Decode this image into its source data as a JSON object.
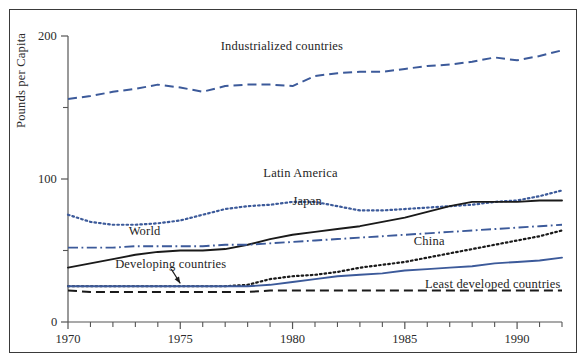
{
  "figure": {
    "background_color": "#ffffff",
    "frame_color": "#3a3a3a",
    "axis_color": "#555555",
    "blue": "#3c5a9a",
    "black": "#1a1a1a"
  },
  "chart_data": {
    "type": "line",
    "title": "",
    "subtitle": "",
    "xlabel": "",
    "ylabel": "Pounds per Capita",
    "xlim": [
      1970,
      1992
    ],
    "ylim": [
      0,
      200
    ],
    "grid": false,
    "legend_position": "inline-annotations",
    "x_major_ticks": [
      1970,
      1975,
      1980,
      1985,
      1990
    ],
    "x_major_tick_labels": [
      "1970",
      "1975",
      "1980",
      "1985",
      "1990"
    ],
    "x_minor_ticks": [
      1971,
      1972,
      1973,
      1974,
      1976,
      1977,
      1978,
      1979,
      1981,
      1982,
      1983,
      1984,
      1986,
      1987,
      1988,
      1989,
      1991,
      1992
    ],
    "y_major_ticks": [
      0,
      100,
      200
    ],
    "y_major_tick_labels": [
      "0",
      "100",
      "200"
    ],
    "y_minor_ticks": [
      50,
      150
    ],
    "x": [
      1970,
      1971,
      1972,
      1973,
      1974,
      1975,
      1976,
      1977,
      1978,
      1979,
      1980,
      1981,
      1982,
      1983,
      1984,
      1985,
      1986,
      1987,
      1988,
      1989,
      1990,
      1991,
      1992
    ],
    "series": [
      {
        "name": "Industrialized countries",
        "color": "#3c5a9a",
        "style": "dashed",
        "label_x": 1976.8,
        "label_y": 193,
        "values": [
          156,
          158,
          161,
          163,
          166,
          164,
          161,
          165,
          166,
          166,
          165,
          172,
          174,
          175,
          175,
          177,
          179,
          180,
          182,
          185,
          183,
          186,
          190
        ]
      },
      {
        "name": "Latin America",
        "color": "#3c5a9a",
        "style": "dotted",
        "label_x": 1978.7,
        "label_y": 104,
        "values": [
          75,
          70,
          68,
          68,
          69,
          71,
          75,
          79,
          81,
          82,
          84,
          84,
          81,
          78,
          78,
          79,
          80,
          81,
          82,
          84,
          85,
          88,
          92
        ]
      },
      {
        "name": "Japan",
        "color": "#1a1a1a",
        "style": "solid",
        "label_x": 1980.0,
        "label_y": 84,
        "values": [
          38,
          41,
          44,
          47,
          49,
          50,
          50,
          51,
          54,
          58,
          61,
          63,
          65,
          67,
          70,
          73,
          77,
          81,
          84,
          84,
          84,
          85,
          85
        ]
      },
      {
        "name": "World",
        "color": "#3c5a9a",
        "style": "dashdot",
        "label_x": 1972.7,
        "label_y": 63,
        "values": [
          52,
          52,
          52,
          53,
          53,
          53,
          53,
          54,
          54,
          55,
          56,
          57,
          58,
          59,
          60,
          61,
          62,
          63,
          64,
          65,
          66,
          67,
          68
        ]
      },
      {
        "name": "China",
        "color": "#1a1a1a",
        "style": "dotted",
        "label_x": 1985.4,
        "label_y": 56,
        "values": [
          25,
          25,
          25,
          25,
          25,
          25,
          25,
          25,
          26,
          30,
          32,
          33,
          35,
          38,
          40,
          42,
          45,
          48,
          51,
          54,
          57,
          60,
          64
        ]
      },
      {
        "name": "Developing countries",
        "color": "#3c5a9a",
        "style": "solid",
        "label_x": 1972.1,
        "label_y": 40,
        "values": [
          25,
          25,
          25,
          25,
          25,
          25,
          25,
          25,
          25,
          26,
          28,
          30,
          32,
          33,
          34,
          36,
          37,
          38,
          39,
          41,
          42,
          43,
          45
        ]
      },
      {
        "name": "Least developed countries",
        "color": "#1a1a1a",
        "style": "dashed",
        "label_x": 1985.9,
        "label_y": 26,
        "values": [
          22,
          21,
          21,
          21,
          21,
          21,
          21,
          21,
          21,
          22,
          22,
          22,
          22,
          22,
          22,
          22,
          22,
          22,
          22,
          22,
          22,
          22,
          22
        ]
      }
    ],
    "annotations": [
      {
        "name": "developing-countries-arrow",
        "from_x": 1974.6,
        "from_y": 37,
        "to_x": 1975.0,
        "to_y": 27
      }
    ]
  }
}
